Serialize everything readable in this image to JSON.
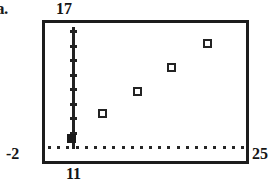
{
  "figure": {
    "item_label": "a.",
    "caption": ""
  },
  "window": {
    "ymax_label": "17",
    "ymin_label": "-2",
    "xmin_label": "11",
    "xmax_label": "25"
  },
  "chart_data": {
    "type": "scatter",
    "title": "",
    "subtitle": "",
    "xlabel": "",
    "ylabel": "",
    "xlim": [
      11,
      25
    ],
    "ylim": [
      -2,
      17
    ],
    "grid": false,
    "legend": null,
    "axis_style": {
      "y_axis_line": true,
      "y_axis_x_value": 12.85,
      "y_tick_interval": 2,
      "x_axis_dotted": true,
      "x_axis_y_value": 0,
      "x_tick_interval": 1
    },
    "marker_style": "open-square",
    "series": [
      {
        "name": "data",
        "x": [
          12.8,
          15.0,
          17.4,
          19.8,
          22.3
        ],
        "y": [
          1.2,
          4.6,
          7.7,
          10.9,
          14.2
        ],
        "points": [
          {
            "x": 12.8,
            "y": 1.2,
            "filled": true
          },
          {
            "x": 15.0,
            "y": 4.6,
            "filled": false
          },
          {
            "x": 17.4,
            "y": 7.7,
            "filled": false
          },
          {
            "x": 19.8,
            "y": 10.9,
            "filled": false
          },
          {
            "x": 22.3,
            "y": 14.2,
            "filled": false
          }
        ]
      }
    ],
    "x_axis_dots": 22,
    "y_axis_ticks": [
      2,
      4,
      6,
      8,
      10,
      12,
      14,
      16
    ],
    "colors": {
      "frame": "#1c1c1c",
      "axis": "#222222",
      "marker": "#232323",
      "text": "#151515",
      "background": "#ffffff"
    }
  }
}
